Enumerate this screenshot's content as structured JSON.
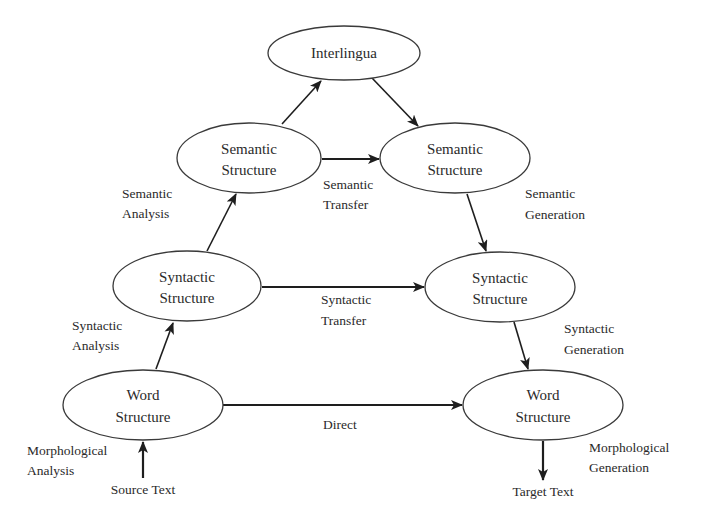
{
  "diagram": {
    "title": "",
    "nodes": {
      "interlingua": {
        "label": "Interlingua"
      },
      "semantic_src": {
        "line1": "Semantic",
        "line2": "Structure"
      },
      "semantic_tgt": {
        "line1": "Semantic",
        "line2": "Structure"
      },
      "syntactic_src": {
        "line1": "Syntactic",
        "line2": "Structure"
      },
      "syntactic_tgt": {
        "line1": "Syntactic",
        "line2": "Structure"
      },
      "word_src": {
        "line1": "Word",
        "line2": "Structure"
      },
      "word_tgt": {
        "line1": "Word",
        "line2": "Structure"
      }
    },
    "edge_labels": {
      "semantic_analysis": {
        "line1": "Semantic",
        "line2": "Analysis"
      },
      "semantic_transfer": {
        "line1": "Semantic",
        "line2": "Transfer"
      },
      "semantic_generation": {
        "line1": "Semantic",
        "line2": "Generation"
      },
      "syntactic_analysis": {
        "line1": "Syntactic",
        "line2": "Analysis"
      },
      "syntactic_transfer": {
        "line1": "Syntactic",
        "line2": "Transfer"
      },
      "syntactic_generation": {
        "line1": "Syntactic",
        "line2": "Generation"
      },
      "direct": {
        "line1": "Direct"
      },
      "morphological_analysis": {
        "line1": "Morphological",
        "line2": "Analysis"
      },
      "morphological_generation": {
        "line1": "Morphological",
        "line2": "Generation"
      }
    },
    "terminals": {
      "source": "Source Text",
      "target": "Target Text"
    },
    "edges": [
      {
        "from": "Source Text",
        "to": "Word Structure (source)"
      },
      {
        "from": "Word Structure (source)",
        "to": "Syntactic Structure (source)"
      },
      {
        "from": "Syntactic Structure (source)",
        "to": "Semantic Structure (source)"
      },
      {
        "from": "Semantic Structure (source)",
        "to": "Interlingua"
      },
      {
        "from": "Interlingua",
        "to": "Semantic Structure (target)"
      },
      {
        "from": "Semantic Structure (source)",
        "to": "Semantic Structure (target)"
      },
      {
        "from": "Syntactic Structure (source)",
        "to": "Syntactic Structure (target)"
      },
      {
        "from": "Word Structure (source)",
        "to": "Word Structure (target)"
      },
      {
        "from": "Semantic Structure (target)",
        "to": "Syntactic Structure (target)"
      },
      {
        "from": "Syntactic Structure (target)",
        "to": "Word Structure (target)"
      },
      {
        "from": "Word Structure (target)",
        "to": "Target Text"
      }
    ],
    "colors": {
      "background": "#ffffff",
      "stroke": "#1e1e1e",
      "text": "#2a2a2a"
    }
  }
}
